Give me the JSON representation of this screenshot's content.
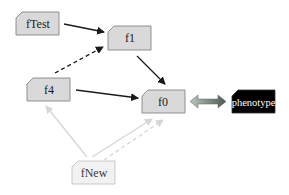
{
  "diagram": {
    "nodes": {
      "fTest": {
        "label": "fTest"
      },
      "f1": {
        "label": "f1"
      },
      "f4": {
        "label": "f4"
      },
      "f0": {
        "label": "f0"
      },
      "phenotype": {
        "label": "phenotype"
      },
      "fNew": {
        "label": "fNew"
      }
    },
    "edges": [
      {
        "from": "fTest",
        "to": "f1",
        "style": "solid",
        "color": "#1a1a1a"
      },
      {
        "from": "f4",
        "to": "f1",
        "style": "dashed",
        "color": "#1a1a1a"
      },
      {
        "from": "f1",
        "to": "f0",
        "style": "solid",
        "color": "#1a1a1a"
      },
      {
        "from": "f4",
        "to": "f0",
        "style": "solid",
        "color": "#1a1a1a"
      },
      {
        "from": "fNew",
        "to": "f4",
        "style": "solid",
        "color": "#d6d6d6"
      },
      {
        "from": "fNew",
        "to": "f0",
        "style": "solid",
        "color": "#d6d6d6"
      },
      {
        "from": "fNew",
        "to": "f0",
        "style": "dashed",
        "color": "#d6d6d6"
      },
      {
        "from": "f0",
        "to": "phenotype",
        "style": "double-arrow",
        "color": "#6e7f72"
      }
    ],
    "colors": {
      "node_fill": "#d9d9d9",
      "node_stroke": "#7a7a7a",
      "faded_fill": "#f2f2f2",
      "faded_stroke": "#bdbdbd",
      "phenotype_fill": "#000000",
      "phenotype_text": "#ffffff"
    }
  }
}
